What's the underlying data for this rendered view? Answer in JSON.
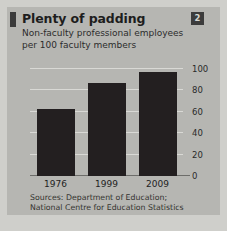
{
  "figure": {
    "badge_number": "2",
    "title": "Plenty of padding",
    "subtitle_line1": "Non-faculty professional employees",
    "subtitle_line2": "per 100 faculty members",
    "source_line1": "Sources: Department of Education;",
    "source_line2": "National Centre for Education Statistics",
    "colors": {
      "panel_background": "#b6b6b2",
      "page_background": "#cfcfcb",
      "bar": "#231f20",
      "gridline": "#d9d9d5",
      "badge": "#3c3c3c",
      "text": "#1d1d1d"
    }
  },
  "chart_data": {
    "type": "bar",
    "title": "Plenty of padding",
    "subtitle": "Non-faculty professional employees per 100 faculty members",
    "categories": [
      "1976",
      "1999",
      "2009"
    ],
    "values": [
      63,
      87,
      97
    ],
    "series": [
      {
        "name": "Non-faculty professional employees per 100 faculty members",
        "values": [
          63,
          87,
          97
        ]
      }
    ],
    "xlabel": "",
    "ylabel": "",
    "ylim": [
      0,
      100
    ],
    "yticks": [
      0,
      20,
      40,
      60,
      80,
      100
    ],
    "ytick_labels": [
      "0",
      "20",
      "40",
      "60",
      "80",
      "100"
    ],
    "y_axis_position": "right",
    "grid": true,
    "legend": false,
    "source": "Sources: Department of Education; National Centre for Education Statistics"
  }
}
